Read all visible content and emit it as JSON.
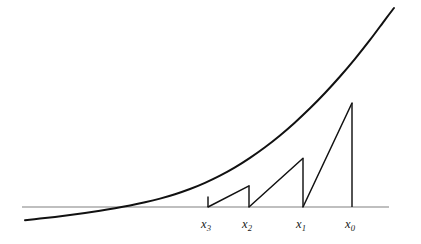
{
  "figure": {
    "kind": "newton-method-illustration",
    "width": 421,
    "height": 244,
    "background_color": "#ffffff"
  },
  "colors": {
    "curve": "#111111",
    "tangent": "#111111",
    "axis": "#808080",
    "ordinate": "#1a1a1a",
    "label_text": "#1a1a1a"
  },
  "axis": {
    "name": "x-axis",
    "y": 207,
    "x_start": 22,
    "x_end": 389
  },
  "labels": [
    {
      "id": "x3",
      "base": "x",
      "sub": "3",
      "text": "x3",
      "x": 208,
      "y": 226
    },
    {
      "id": "x2",
      "base": "x",
      "sub": "2",
      "text": "x2",
      "x": 249,
      "y": 226
    },
    {
      "id": "x1",
      "base": "x",
      "sub": "1",
      "text": "x1",
      "x": 303,
      "y": 226
    },
    {
      "id": "x0",
      "base": "x",
      "sub": "0",
      "text": "x0",
      "x": 352,
      "y": 226
    }
  ],
  "chart_data": {
    "type": "line",
    "title": "",
    "xlabel": "",
    "ylabel": "",
    "grid": false,
    "legend": "none",
    "root_x": 178,
    "axis_y": 207,
    "curve": {
      "name": "f(x)",
      "points_px": [
        [
          25,
          220.2
        ],
        [
          40,
          218.6
        ],
        [
          55,
          216.9
        ],
        [
          70,
          215.0
        ],
        [
          85,
          213.0
        ],
        [
          100,
          210.8
        ],
        [
          115,
          208.3
        ],
        [
          130,
          205.5
        ],
        [
          145,
          202.3
        ],
        [
          160,
          198.6
        ],
        [
          175,
          194.2
        ],
        [
          190,
          189.0
        ],
        [
          205,
          182.8
        ],
        [
          220,
          175.6
        ],
        [
          235,
          167.3
        ],
        [
          250,
          157.8
        ],
        [
          265,
          147.2
        ],
        [
          280,
          135.4
        ],
        [
          295,
          122.4
        ],
        [
          310,
          108.3
        ],
        [
          325,
          93.0
        ],
        [
          340,
          76.5
        ],
        [
          355,
          58.8
        ],
        [
          370,
          39.9
        ],
        [
          385,
          19.8
        ],
        [
          394,
          8.0
        ]
      ]
    },
    "iterates": [
      {
        "label": "x0",
        "x_px": 352,
        "fx_px": 103.0
      },
      {
        "label": "x1",
        "x_px": 303,
        "fx_px": 158.2
      },
      {
        "label": "x2",
        "x_px": 249,
        "fx_px": 185.8
      },
      {
        "label": "x3",
        "x_px": 208,
        "fx_px": 196.5
      }
    ],
    "ordinates": [
      {
        "name": "ordinate-x0",
        "x": 352,
        "y_top": 103.0,
        "y_bottom": 207
      },
      {
        "name": "ordinate-x1",
        "x": 303,
        "y_top": 158.2,
        "y_bottom": 207
      },
      {
        "name": "ordinate-x2",
        "x": 249,
        "y_top": 185.8,
        "y_bottom": 207
      },
      {
        "name": "ordinate-x3",
        "x": 208,
        "y_top": 196.5,
        "y_bottom": 207
      }
    ],
    "tangents": [
      {
        "name": "tangent-at-x0",
        "from": [
          352,
          103.0
        ],
        "to": [
          303,
          207
        ]
      },
      {
        "name": "tangent-at-x1",
        "from": [
          303,
          158.2
        ],
        "to": [
          249,
          207
        ]
      },
      {
        "name": "tangent-at-x2",
        "from": [
          249,
          185.8
        ],
        "to": [
          208,
          207
        ]
      }
    ]
  }
}
